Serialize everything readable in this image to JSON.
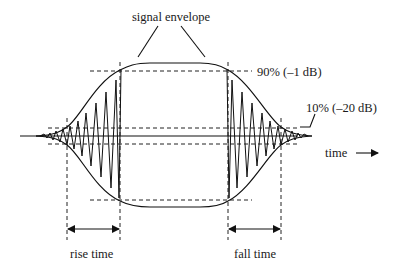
{
  "diagram": {
    "labels": {
      "signal_envelope": "signal envelope",
      "level_90": "90% (–1 dB)",
      "level_10": "10% (–20 dB)",
      "time_axis": "time",
      "rise_time": "rise time",
      "fall_time": "fall time"
    },
    "icons": {
      "time_arrow": "right-arrow-icon",
      "rise_arrow": "double-headed-arrow-icon",
      "fall_arrow": "double-headed-arrow-icon"
    },
    "levels": [
      {
        "name": "90%",
        "db": "-1 dB"
      },
      {
        "name": "10%",
        "db": "-20 dB"
      }
    ],
    "colors": {
      "line": "#111111",
      "background": "#ffffff"
    }
  }
}
